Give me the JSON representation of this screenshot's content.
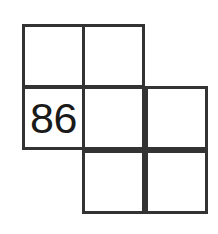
{
  "figure": {
    "background_color": "#ffffff",
    "line_color": "#333333",
    "text_color": "#1a1a1a",
    "line_width_px": 3
  },
  "grid": {
    "rows": 3,
    "columns": 3,
    "cell_width_px": 63,
    "cell_height_px": 64,
    "cells": [
      {
        "id": "cell-r0c0",
        "row": 0,
        "col": 0,
        "present": true,
        "value": ""
      },
      {
        "id": "cell-r0c1",
        "row": 0,
        "col": 1,
        "present": true,
        "value": ""
      },
      {
        "id": "cell-r0c2",
        "row": 0,
        "col": 2,
        "present": false,
        "value": ""
      },
      {
        "id": "cell-r1c0",
        "row": 1,
        "col": 0,
        "present": true,
        "value": "86"
      },
      {
        "id": "cell-r1c1",
        "row": 1,
        "col": 1,
        "present": true,
        "value": ""
      },
      {
        "id": "cell-r1c2",
        "row": 1,
        "col": 2,
        "present": true,
        "value": ""
      },
      {
        "id": "cell-r2c0",
        "row": 2,
        "col": 0,
        "present": false,
        "value": ""
      },
      {
        "id": "cell-r2c1",
        "row": 2,
        "col": 1,
        "present": true,
        "value": ""
      },
      {
        "id": "cell-r2c2",
        "row": 2,
        "col": 2,
        "present": true,
        "value": ""
      }
    ]
  }
}
